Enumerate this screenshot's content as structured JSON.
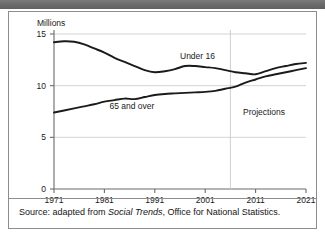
{
  "header_band": {
    "text": ""
  },
  "figure": {
    "source_prefix": "Source: adapted from",
    "source_italic": "Social Trends",
    "source_suffix": ", Office for National Statistics."
  },
  "chart_data": {
    "type": "line",
    "title": "",
    "subtitle": "",
    "xlabel": "",
    "ylabel": "Millions",
    "ylabel_position": "above-axis",
    "grid": true,
    "grid_axis": "y",
    "legend": "none",
    "legend_position": "inline-annotations",
    "xlim": [
      1971,
      2021
    ],
    "ylim": [
      0,
      15
    ],
    "yticks": [
      0,
      5,
      10,
      15
    ],
    "ytick_labels": [
      "0",
      "5",
      "10",
      "15"
    ],
    "xticks": [
      1971,
      1981,
      1991,
      2001,
      2011,
      2021
    ],
    "xtick_labels": [
      "1971",
      "1981",
      "1991",
      "2001",
      "2011",
      "2021"
    ],
    "annotations": [
      {
        "text": "Under 16",
        "x": 1996,
        "y": 12.9
      },
      {
        "text": "65 and over",
        "x": 1982,
        "y": 8.0
      },
      {
        "text": "Projections",
        "x": 2008.5,
        "y": 7.5
      }
    ],
    "divider": {
      "label": "Projections",
      "x": 2006,
      "style": "vertical-line"
    },
    "series": [
      {
        "name": "Under 16",
        "color": "#1a1a1a",
        "x": [
          1971,
          1973,
          1975,
          1977,
          1979,
          1981,
          1983,
          1985,
          1987,
          1989,
          1991,
          1993,
          1995,
          1997,
          1999,
          2001,
          2003,
          2005,
          2007,
          2009,
          2011,
          2013,
          2015,
          2017,
          2019,
          2021
        ],
        "values": [
          14.2,
          14.3,
          14.25,
          14.0,
          13.6,
          13.2,
          12.7,
          12.3,
          11.9,
          11.5,
          11.3,
          11.4,
          11.6,
          11.9,
          11.9,
          11.8,
          11.7,
          11.5,
          11.3,
          11.2,
          11.1,
          11.4,
          11.7,
          11.9,
          12.1,
          12.2
        ]
      },
      {
        "name": "65 and over",
        "color": "#1a1a1a",
        "x": [
          1971,
          1973,
          1975,
          1977,
          1979,
          1981,
          1983,
          1985,
          1987,
          1989,
          1991,
          1993,
          1995,
          1997,
          1999,
          2001,
          2003,
          2005,
          2007,
          2009,
          2011,
          2013,
          2015,
          2017,
          2019,
          2021
        ],
        "values": [
          7.4,
          7.6,
          7.8,
          8.0,
          8.2,
          8.45,
          8.6,
          8.75,
          8.7,
          8.9,
          9.1,
          9.2,
          9.25,
          9.3,
          9.35,
          9.4,
          9.5,
          9.7,
          9.9,
          10.3,
          10.6,
          10.9,
          11.1,
          11.3,
          11.5,
          11.7
        ]
      }
    ]
  }
}
